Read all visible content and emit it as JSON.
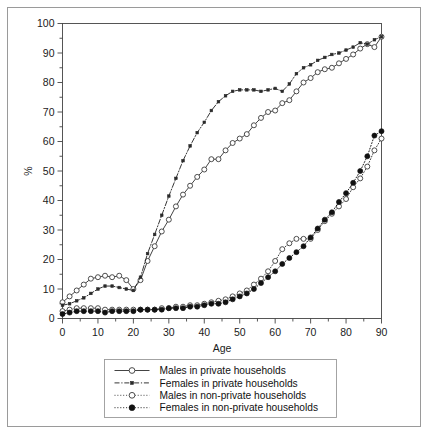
{
  "figure": {
    "background": "#ffffff",
    "frame_color": "#9a9a9a",
    "axis_color": "#444444"
  },
  "chart_data": {
    "type": "line",
    "title": "",
    "xlabel": "Age",
    "ylabel": "%",
    "xlim": [
      0,
      90
    ],
    "ylim": [
      0,
      100
    ],
    "xticks": [
      0,
      10,
      20,
      30,
      40,
      50,
      60,
      70,
      80,
      90
    ],
    "xtick_labels": [
      "0",
      "10",
      "20",
      "30",
      "40",
      "50",
      "60",
      "70",
      "80",
      "90"
    ],
    "yticks": [
      0,
      10,
      20,
      30,
      40,
      50,
      60,
      70,
      80,
      90,
      100
    ],
    "ytick_labels": [
      "0",
      "10",
      "20",
      "30",
      "40",
      "50",
      "60",
      "70",
      "80",
      "90",
      "100"
    ],
    "xminor_step": 5,
    "yminor_step": 5,
    "grid": false,
    "legend_position": "below-plot",
    "x": [
      0,
      2,
      4,
      6,
      8,
      10,
      12,
      14,
      16,
      18,
      20,
      22,
      24,
      26,
      28,
      30,
      32,
      34,
      36,
      38,
      40,
      42,
      44,
      46,
      48,
      50,
      52,
      54,
      56,
      58,
      60,
      62,
      64,
      66,
      68,
      70,
      72,
      74,
      76,
      78,
      80,
      82,
      84,
      86,
      88,
      90
    ],
    "series": [
      {
        "name": "Males in private households",
        "marker": "open-circle",
        "line": "solid",
        "color": "#3a3a3a",
        "values": [
          5.5,
          7.5,
          9.5,
          11.5,
          13.5,
          14.0,
          14.5,
          14.0,
          14.5,
          13.0,
          10.0,
          13.0,
          19.5,
          24.5,
          29.5,
          33.5,
          38.0,
          42.0,
          45.0,
          48.0,
          50.5,
          54.0,
          54.0,
          57.0,
          59.5,
          61.0,
          62.5,
          65.5,
          68.0,
          70.0,
          70.5,
          73.0,
          74.0,
          77.0,
          80.0,
          81.5,
          83.5,
          84.5,
          85.0,
          86.5,
          88.0,
          89.5,
          91.5,
          93.0,
          92.0,
          95.5
        ]
      },
      {
        "name": "Females in private households",
        "marker": "small-square",
        "line": "dash-dot",
        "color": "#2a2a2a",
        "values": [
          4.5,
          5.0,
          6.0,
          7.0,
          8.5,
          10.0,
          11.0,
          11.0,
          10.5,
          10.0,
          9.5,
          14.0,
          22.0,
          28.5,
          35.0,
          41.5,
          47.5,
          53.5,
          58.5,
          63.0,
          66.5,
          70.5,
          73.5,
          75.5,
          77.0,
          77.5,
          77.5,
          77.5,
          77.0,
          77.5,
          78.0,
          77.0,
          79.5,
          83.0,
          85.0,
          86.0,
          87.5,
          88.5,
          89.5,
          90.0,
          91.0,
          92.0,
          93.5,
          93.0,
          94.5,
          95.5
        ]
      },
      {
        "name": "Males in non-private households",
        "marker": "open-circle",
        "line": "dotted",
        "color": "#3a3a3a",
        "values": [
          2.5,
          3.0,
          3.5,
          3.5,
          3.5,
          3.5,
          3.0,
          3.0,
          3.0,
          3.0,
          3.0,
          3.0,
          3.0,
          3.0,
          3.5,
          3.5,
          4.0,
          4.0,
          4.5,
          4.5,
          5.0,
          5.5,
          6.0,
          6.5,
          7.5,
          8.5,
          9.5,
          11.5,
          13.5,
          16.0,
          19.5,
          23.5,
          25.5,
          27.0,
          27.0,
          27.0,
          30.0,
          33.0,
          35.5,
          38.0,
          40.5,
          44.5,
          47.5,
          51.5,
          57.0,
          61.0
        ]
      },
      {
        "name": "Females in non-private households",
        "marker": "filled-circle",
        "line": "dotted",
        "color": "#111111",
        "values": [
          1.5,
          2.0,
          2.5,
          2.5,
          2.5,
          2.5,
          2.0,
          2.5,
          2.5,
          2.5,
          2.5,
          3.0,
          3.0,
          3.0,
          3.0,
          3.5,
          3.5,
          3.5,
          4.0,
          4.0,
          4.5,
          5.0,
          5.0,
          5.5,
          6.5,
          7.5,
          8.5,
          10.0,
          12.0,
          14.0,
          16.0,
          18.5,
          20.5,
          22.5,
          24.5,
          27.5,
          30.5,
          33.5,
          36.0,
          39.5,
          42.5,
          46.0,
          50.0,
          55.0,
          62.0,
          63.5
        ]
      }
    ]
  },
  "legend": {
    "items": [
      {
        "label": "Males in private households",
        "marker": "open-circle",
        "line": "solid"
      },
      {
        "label": "Females in private households",
        "marker": "small-square",
        "line": "dash-dot"
      },
      {
        "label": "Males in non-private households",
        "marker": "open-circle",
        "line": "dotted"
      },
      {
        "label": "Females in non-private households",
        "marker": "filled-circle",
        "line": "dotted"
      }
    ]
  }
}
